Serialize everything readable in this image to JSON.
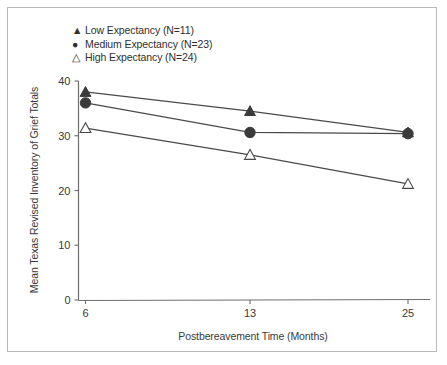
{
  "figure": {
    "background_color": "#ffffff",
    "frame_color": "#b9b9b9",
    "line_color": "#4a4a4a",
    "marker_fill": "#3a3a3a",
    "marker_open_fill": "#ffffff"
  },
  "legend": {
    "position": "top-left",
    "entries": [
      {
        "marker": "filled-triangle-icon",
        "glyph": "▲",
        "label": "Low Expectancy (N=11)"
      },
      {
        "marker": "filled-circle-icon",
        "glyph": "●",
        "label": "Medium Expectancy (N=23)"
      },
      {
        "marker": "open-triangle-icon",
        "glyph": "△",
        "label": "High Expectancy (N=24)"
      }
    ]
  },
  "chart_data": {
    "type": "line",
    "title": "",
    "xlabel": "Postbereavement Time (Months)",
    "ylabel": "Mean Texas Revised Inventory of Grief Totals",
    "x": [
      6,
      13,
      25
    ],
    "xtick_labels": [
      "6",
      "13",
      "25"
    ],
    "ytick_labels": [
      "0",
      "10",
      "20",
      "30",
      "40"
    ],
    "yticks": [
      0,
      10,
      20,
      30,
      40
    ],
    "ylim": [
      0,
      40
    ],
    "grid": false,
    "legend_position": "upper-left",
    "series": [
      {
        "name": "Low Expectancy (N=11)",
        "n": 11,
        "marker": "filled-triangle",
        "values": [
          38.0,
          34.5,
          30.6
        ]
      },
      {
        "name": "Medium Expectancy (N=23)",
        "n": 23,
        "marker": "filled-circle",
        "values": [
          36.0,
          30.6,
          30.4
        ]
      },
      {
        "name": "High Expectancy (N=24)",
        "n": 24,
        "marker": "open-triangle",
        "values": [
          31.4,
          26.5,
          21.2
        ]
      }
    ]
  }
}
